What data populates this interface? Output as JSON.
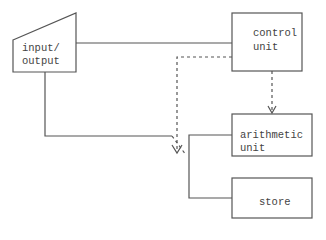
{
  "diagram": {
    "title": "",
    "nodes": {
      "io": {
        "line1": "input/",
        "line2": "output"
      },
      "control": {
        "line1": "control",
        "line2": "unit"
      },
      "arithmetic": {
        "line1": "arithmetic",
        "line2": "unit"
      },
      "store": {
        "label": "store"
      }
    },
    "edges": [
      {
        "from": "input/output",
        "to": "control unit",
        "style": "solid"
      },
      {
        "from": "control unit",
        "to": "switch",
        "style": "dashed",
        "arrow": true
      },
      {
        "from": "control unit",
        "to": "arithmetic unit",
        "style": "dashed",
        "arrow": true
      },
      {
        "from": "input/output",
        "to": "switch",
        "style": "solid"
      },
      {
        "from": "switch",
        "to": "arithmetic unit / store",
        "style": "solid"
      }
    ],
    "colors": {
      "stroke": "#555555",
      "text": "#444444",
      "background": "#ffffff"
    }
  }
}
